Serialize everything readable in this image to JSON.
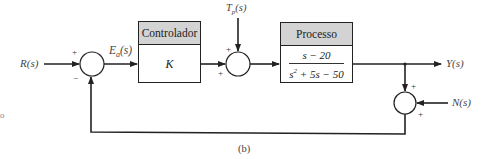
{
  "diagram": {
    "type": "block-diagram",
    "caption": "(b)",
    "stray_mark": "o",
    "signals": {
      "input": "R(s)",
      "error": {
        "base": "E",
        "sub": "a",
        "arg": "(s)"
      },
      "disturbance": {
        "base": "T",
        "sub": "p",
        "arg": "(s)"
      },
      "output": "Y(s)",
      "noise": "N(s)"
    },
    "blocks": {
      "controller": {
        "title": "Controlador",
        "gain": "K"
      },
      "process": {
        "title": "Processo",
        "numerator": "s − 20",
        "denominator_pre": "s",
        "denominator_exp": "2",
        "denominator_post": " + 5s − 50"
      }
    },
    "summing_junctions": {
      "error_sum": {
        "top_sign": "+",
        "bottom_sign": "−"
      },
      "disturbance_sum": {
        "top_sign": "+",
        "left_sign": "+"
      },
      "noise_sum": {
        "top_sign": "+",
        "right_sign": "+"
      }
    },
    "colors": {
      "line": "#222222",
      "header_fill": "#d3d3d3",
      "background": "#ffffff"
    }
  }
}
